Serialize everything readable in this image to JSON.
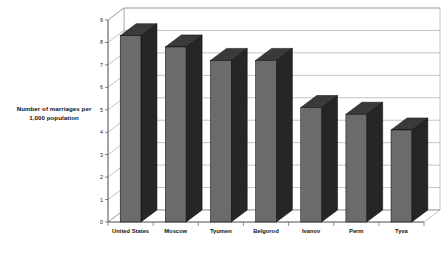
{
  "chart_data": {
    "type": "bar",
    "title": "",
    "subtitle": "",
    "xlabel": "",
    "ylabel": "Number of marriages per 1,000 population",
    "ylabel_line1": "Number of marriages per",
    "ylabel_line2": "1,000 population",
    "categories": [
      "United States",
      "Moscow",
      "Tyumen",
      "Belgorod",
      "Ivanov",
      "Perm",
      "Tyva"
    ],
    "values": [
      8.3,
      7.8,
      7.2,
      7.2,
      5.1,
      4.8,
      4.1
    ],
    "ylim": [
      0,
      9
    ],
    "ytick_step": 1,
    "ytick_labels": [
      "0",
      "1",
      "2",
      "3",
      "4",
      "5",
      "6",
      "7",
      "8",
      "9"
    ],
    "grid": true,
    "grid_axis": "y",
    "legend": false,
    "style": "3d-column",
    "colors": {
      "bar_front": "#6b6b6b",
      "bar_side": "#262626",
      "bar_top": "#3a3a3a",
      "bar_outline": "#000000",
      "grid_line": "#9a9a9a",
      "axis_line": "#4d4d4d",
      "background": "#ffffff",
      "text": "#111111"
    }
  }
}
